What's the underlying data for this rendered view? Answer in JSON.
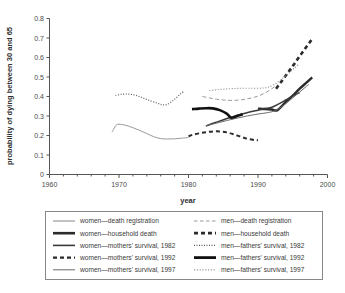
{
  "chart_data": {
    "type": "line",
    "title": "",
    "xlabel": "year",
    "ylabel": "probability of dying between 30 and 65",
    "xlim": [
      1960,
      2000
    ],
    "ylim": [
      0,
      0.8
    ],
    "xticks": [
      1960,
      1970,
      1980,
      1990,
      2000
    ],
    "xtick_labels": [
      "1960",
      "1970",
      "1980",
      "1990",
      "2000"
    ],
    "xminor_step": 2,
    "yticks": [
      0,
      0.1,
      0.2,
      0.3,
      0.4,
      0.5,
      0.6,
      0.7,
      0.8
    ],
    "ytick_labels": [
      "0",
      "0.1",
      "0.2",
      "0.3",
      "0.4",
      "0.5",
      "0.6",
      "0.7",
      "0.8"
    ],
    "grid": false,
    "legend_position": "below-plot",
    "series": [
      {
        "name": "women—death registration",
        "style": "solid-thin-light",
        "color": "#9a9a9a",
        "width": 1.0,
        "dash": "",
        "points": [
          [
            1969.0,
            0.218
          ],
          [
            1969.3,
            0.237
          ],
          [
            1969.6,
            0.253
          ],
          [
            1970.0,
            0.258
          ],
          [
            1971.0,
            0.252
          ],
          [
            1972.0,
            0.24
          ],
          [
            1973.0,
            0.226
          ],
          [
            1974.0,
            0.21
          ],
          [
            1975.0,
            0.194
          ],
          [
            1976.0,
            0.184
          ],
          [
            1977.0,
            0.182
          ],
          [
            1978.0,
            0.183
          ],
          [
            1979.0,
            0.186
          ],
          [
            1980.0,
            0.19
          ]
        ]
      },
      {
        "name": "men—death registration",
        "style": "dashed-light",
        "color": "#9a9a9a",
        "width": 1.0,
        "dash": "4,2.5",
        "points": [
          [
            1982.0,
            0.4
          ],
          [
            1983.0,
            0.393
          ],
          [
            1984.0,
            0.386
          ],
          [
            1985.0,
            0.382
          ],
          [
            1986.0,
            0.38
          ],
          [
            1987.0,
            0.381
          ],
          [
            1988.0,
            0.385
          ],
          [
            1989.0,
            0.392
          ],
          [
            1990.0,
            0.402
          ],
          [
            1991.0,
            0.418
          ],
          [
            1992.0,
            0.44
          ],
          [
            1992.8,
            0.462
          ]
        ]
      },
      {
        "name": "women—household death",
        "style": "solid-thick-dark",
        "color": "#2b2b2b",
        "width": 2.4,
        "dash": "",
        "points": [
          [
            1990.0,
            0.338
          ],
          [
            1991.0,
            0.336
          ],
          [
            1992.0,
            0.333
          ],
          [
            1992.8,
            0.33
          ],
          [
            1994.0,
            0.372
          ],
          [
            1995.0,
            0.405
          ],
          [
            1996.0,
            0.44
          ],
          [
            1997.0,
            0.472
          ],
          [
            1997.8,
            0.498
          ]
        ]
      },
      {
        "name": "men—household death",
        "style": "dashed-thick-dark",
        "color": "#2b2b2b",
        "width": 2.6,
        "dash": "4,3",
        "points": [
          [
            1992.6,
            0.44
          ],
          [
            1993.4,
            0.478
          ],
          [
            1994.2,
            0.517
          ],
          [
            1995.0,
            0.556
          ],
          [
            1995.8,
            0.597
          ],
          [
            1996.6,
            0.637
          ],
          [
            1997.4,
            0.676
          ],
          [
            1997.9,
            0.698
          ]
        ]
      },
      {
        "name": "women—mothers' survival, 1982",
        "style": "solid-medium-dark",
        "color": "#3a3a3a",
        "width": 1.5,
        "dash": "",
        "points": [
          [
            1982.5,
            0.249
          ],
          [
            1984.0,
            0.268
          ],
          [
            1986.0,
            0.292
          ],
          [
            1988.0,
            0.313
          ],
          [
            1990.0,
            0.33
          ],
          [
            1991.0,
            0.338
          ],
          [
            1992.0,
            0.345
          ],
          [
            1993.0,
            0.362
          ],
          [
            1994.0,
            0.382
          ],
          [
            1995.0,
            0.403
          ],
          [
            1996.0,
            0.42
          ]
        ]
      },
      {
        "name": "men—fathers' survival, 1982",
        "style": "dotted-fine-dark",
        "color": "#5a5a5a",
        "width": 1.2,
        "dash": "1,1.6",
        "points": [
          [
            1969.5,
            0.405
          ],
          [
            1970.5,
            0.412
          ],
          [
            1971.5,
            0.412
          ],
          [
            1972.5,
            0.405
          ],
          [
            1973.5,
            0.392
          ],
          [
            1974.5,
            0.378
          ],
          [
            1975.5,
            0.366
          ],
          [
            1976.2,
            0.358
          ],
          [
            1976.8,
            0.358
          ],
          [
            1977.5,
            0.372
          ],
          [
            1978.2,
            0.392
          ],
          [
            1978.8,
            0.412
          ],
          [
            1979.3,
            0.426
          ]
        ]
      },
      {
        "name": "women—mothers' survival, 1992",
        "style": "dashed-thick-dark-short",
        "color": "#2b2b2b",
        "width": 2.0,
        "dash": "4,3",
        "points": [
          [
            1980.0,
            0.196
          ],
          [
            1980.6,
            0.204
          ],
          [
            1981.5,
            0.211
          ],
          [
            1982.5,
            0.217
          ],
          [
            1983.5,
            0.221
          ],
          [
            1984.5,
            0.221
          ],
          [
            1985.5,
            0.216
          ],
          [
            1986.5,
            0.206
          ],
          [
            1987.5,
            0.194
          ],
          [
            1988.5,
            0.183
          ],
          [
            1989.5,
            0.177
          ],
          [
            1990.0,
            0.176
          ]
        ]
      },
      {
        "name": "men—fathers' survival, 1992",
        "style": "solid-thick-black",
        "color": "#111111",
        "width": 2.6,
        "dash": "",
        "points": [
          [
            1980.5,
            0.335
          ],
          [
            1981.5,
            0.338
          ],
          [
            1982.5,
            0.34
          ],
          [
            1983.5,
            0.339
          ],
          [
            1984.5,
            0.33
          ],
          [
            1985.5,
            0.312
          ],
          [
            1986.2,
            0.29
          ],
          [
            1987.0,
            0.3
          ],
          [
            1987.8,
            0.309
          ]
        ]
      },
      {
        "name": "women—mothers' survival, 1997",
        "style": "solid-thin-dark",
        "color": "#6a6a6a",
        "width": 1.0,
        "dash": "",
        "points": [
          [
            1982.5,
            0.25
          ],
          [
            1984.0,
            0.263
          ],
          [
            1986.0,
            0.281
          ],
          [
            1988.0,
            0.297
          ],
          [
            1990.0,
            0.31
          ],
          [
            1991.5,
            0.318
          ],
          [
            1992.5,
            0.328
          ],
          [
            1993.5,
            0.35
          ],
          [
            1994.5,
            0.378
          ],
          [
            1995.5,
            0.408
          ],
          [
            1996.5,
            0.438
          ],
          [
            1997.3,
            0.462
          ]
        ]
      },
      {
        "name": "men—fathers' survival, 1997",
        "style": "dotted-light",
        "color": "#9a9a9a",
        "width": 1.1,
        "dash": "1.2,1.6",
        "points": [
          [
            1983.0,
            0.43
          ],
          [
            1984.5,
            0.436
          ],
          [
            1986.0,
            0.44
          ],
          [
            1987.5,
            0.442
          ],
          [
            1989.0,
            0.442
          ],
          [
            1990.5,
            0.443
          ],
          [
            1991.5,
            0.448
          ],
          [
            1992.5,
            0.465
          ],
          [
            1993.5,
            0.492
          ],
          [
            1994.5,
            0.522
          ],
          [
            1995.3,
            0.548
          ],
          [
            1995.8,
            0.562
          ]
        ]
      }
    ],
    "legend": [
      {
        "label": "women—death registration",
        "style": "solid-thin-light",
        "color": "#9a9a9a",
        "width": 1.2,
        "dash": "",
        "column": 0,
        "row": 0
      },
      {
        "label": "men—death registration",
        "style": "dashed-light",
        "color": "#9a9a9a",
        "width": 1.2,
        "dash": "3.5,2.5",
        "column": 1,
        "row": 0
      },
      {
        "label": "women—household death",
        "style": "solid-thick-dark",
        "color": "#2b2b2b",
        "width": 2.6,
        "dash": "",
        "column": 0,
        "row": 1
      },
      {
        "label": "men—household death",
        "style": "dashed-thick-dark",
        "color": "#2b2b2b",
        "width": 2.8,
        "dash": "4,3",
        "column": 1,
        "row": 1
      },
      {
        "label": "women—mothers' survival, 1982",
        "style": "solid-medium-dark",
        "color": "#3a3a3a",
        "width": 1.6,
        "dash": "",
        "column": 0,
        "row": 2
      },
      {
        "label": "men—fathers' survival, 1982",
        "style": "dotted-fine-dark",
        "color": "#5a5a5a",
        "width": 1.2,
        "dash": "1,1.5",
        "column": 1,
        "row": 2
      },
      {
        "label": "women—mothers' survival, 1992",
        "style": "dashed-thick-dark-short",
        "color": "#2b2b2b",
        "width": 2.2,
        "dash": "4,3",
        "column": 0,
        "row": 3
      },
      {
        "label": "men—fathers' survival, 1992",
        "style": "solid-thick-black",
        "color": "#111111",
        "width": 2.8,
        "dash": "",
        "column": 1,
        "row": 3
      },
      {
        "label": "women—mothers' survival, 1997",
        "style": "solid-thin-dark",
        "color": "#6a6a6a",
        "width": 1.0,
        "dash": "",
        "column": 0,
        "row": 4
      },
      {
        "label": "men—fathers' survival, 1997",
        "style": "dotted-light",
        "color": "#9a9a9a",
        "width": 1.2,
        "dash": "1.2,1.6",
        "column": 1,
        "row": 4
      }
    ]
  },
  "colors": {
    "background": "#ffffff",
    "axis": "#555555",
    "text": "#3a3a3a",
    "legend_border": "#888888"
  }
}
